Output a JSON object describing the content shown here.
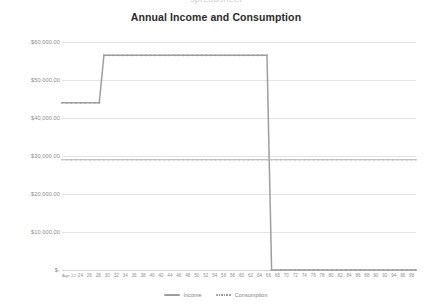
{
  "top_clipped_text": "spreadsheet",
  "chart_data": {
    "type": "line",
    "title": "Annual Income and Consumption",
    "xlabel": "",
    "ylabel": "",
    "grid": true,
    "legend_position": "bottom",
    "ylim": [
      0,
      60000
    ],
    "yticks": [
      "$-",
      "$10,000.00",
      "$20,000.00",
      "$30,000.00",
      "$40,000.00",
      "$50,000.00",
      "$60,000.00"
    ],
    "ytick_values": [
      0,
      10000,
      20000,
      30000,
      40000,
      50000,
      60000
    ],
    "x": [
      22,
      23,
      24,
      25,
      26,
      27,
      28,
      29,
      30,
      31,
      32,
      33,
      34,
      35,
      36,
      37,
      38,
      39,
      40,
      41,
      42,
      43,
      44,
      45,
      46,
      47,
      48,
      49,
      50,
      51,
      52,
      53,
      54,
      55,
      56,
      57,
      58,
      59,
      60,
      61,
      62,
      63,
      64,
      65,
      66,
      67,
      68,
      69,
      70,
      71,
      72,
      73,
      74,
      75,
      76,
      77,
      78,
      79,
      80,
      81,
      82,
      83,
      84,
      85,
      86,
      87,
      88,
      89,
      90,
      91,
      92,
      93,
      94,
      95,
      96,
      97,
      98
    ],
    "xtick_labels": [
      "Age 22",
      "24",
      "26",
      "28",
      "30",
      "32",
      "34",
      "36",
      "38",
      "40",
      "42",
      "44",
      "46",
      "48",
      "50",
      "52",
      "54",
      "56",
      "58",
      "60",
      "62",
      "64",
      "66",
      "68",
      "70",
      "72",
      "74",
      "76",
      "78",
      "80",
      "82",
      "84",
      "86",
      "88",
      "90",
      "92",
      "94",
      "96",
      "98"
    ],
    "xlim": [
      22,
      98
    ],
    "series": [
      {
        "name": "Income",
        "color": "#9e9e9e",
        "style": "solid-marker",
        "values": [
          44000,
          44000,
          44000,
          44000,
          44000,
          44000,
          44000,
          44000,
          44000,
          56500,
          56500,
          56500,
          56500,
          56500,
          56500,
          56500,
          56500,
          56500,
          56500,
          56500,
          56500,
          56500,
          56500,
          56500,
          56500,
          56500,
          56500,
          56500,
          56500,
          56500,
          56500,
          56500,
          56500,
          56500,
          56500,
          56500,
          56500,
          56500,
          56500,
          56500,
          56500,
          56500,
          56500,
          56500,
          56500,
          0,
          0,
          0,
          0,
          0,
          0,
          0,
          0,
          0,
          0,
          0,
          0,
          0,
          0,
          0,
          0,
          0,
          0,
          0,
          0,
          0,
          0,
          0,
          0,
          0,
          0,
          0,
          0,
          0,
          0,
          0,
          0
        ]
      },
      {
        "name": "Consumption",
        "color": "#b5b5b5",
        "style": "dotted-marker",
        "values": [
          29000,
          29000,
          29000,
          29000,
          29000,
          29000,
          29000,
          29000,
          29000,
          29000,
          29000,
          29000,
          29000,
          29000,
          29000,
          29000,
          29000,
          29000,
          29000,
          29000,
          29000,
          29000,
          29000,
          29000,
          29000,
          29000,
          29000,
          29000,
          29000,
          29000,
          29000,
          29000,
          29000,
          29000,
          29000,
          29000,
          29000,
          29000,
          29000,
          29000,
          29000,
          29000,
          29000,
          29000,
          29000,
          29000,
          29000,
          29000,
          29000,
          29000,
          29000,
          29000,
          29000,
          29000,
          29000,
          29000,
          29000,
          29000,
          29000,
          29000,
          29000,
          29000,
          29000,
          29000,
          29000,
          29000,
          29000,
          29000,
          29000,
          29000,
          29000,
          29000,
          29000,
          29000,
          29000,
          29000,
          29000
        ]
      }
    ],
    "annotations": {
      "income_raise_age": 31,
      "retirement_age": 67
    }
  },
  "legend": {
    "items": [
      {
        "label": "Income"
      },
      {
        "label": "Consumption"
      }
    ]
  }
}
